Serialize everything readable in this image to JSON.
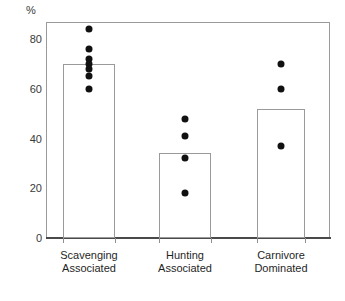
{
  "chart_data": {
    "type": "bar",
    "title": "",
    "subtitle": "",
    "xlabel": "",
    "ylabel": "%",
    "ylim": [
      0,
      90
    ],
    "yticks": [
      0,
      20,
      40,
      60,
      80
    ],
    "ytick_labels": [
      "0",
      "20",
      "40",
      "60",
      "80"
    ],
    "grid": false,
    "legend": "none",
    "categories": [
      "Scavenging Associated",
      "Hunting Associated",
      "Carnivore Dominated"
    ],
    "category_lines": [
      [
        "Scavenging",
        "Associated"
      ],
      [
        "Hunting",
        "Associated"
      ],
      [
        "Carnivore",
        "Dominated"
      ]
    ],
    "values": [
      70,
      34,
      52
    ],
    "bar_style": {
      "fill": "#ffffff",
      "edge": "#9a9a9a",
      "edge_width": 1
    },
    "overlay": {
      "type": "scatter",
      "marker": "filled-circle",
      "color": "#111111",
      "size": 7,
      "points_by_category": [
        [
          84,
          76,
          72,
          70,
          68,
          65,
          60
        ],
        [
          48,
          41,
          32,
          18
        ],
        [
          70,
          60,
          37
        ]
      ]
    }
  },
  "axis": {
    "unit_label": "%",
    "y_tick_0": "0",
    "y_tick_20": "20",
    "y_tick_40": "40",
    "y_tick_60": "60",
    "y_tick_80": "80"
  }
}
